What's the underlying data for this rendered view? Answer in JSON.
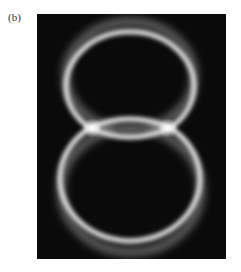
{
  "figure": {
    "label": "(b)",
    "colors": {
      "background": "#0a0a0a",
      "ring": "#e8e8e8",
      "page": "#ffffff"
    }
  }
}
